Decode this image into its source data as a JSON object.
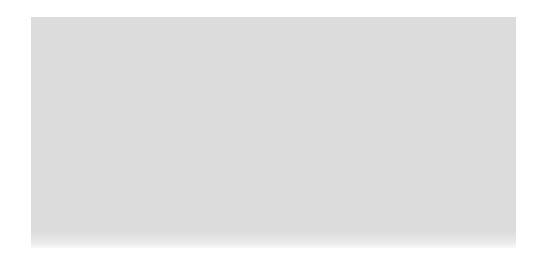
{
  "canvas": {
    "width": 547,
    "height": 267,
    "background_color": "#ffffff",
    "description": "Blank white page containing a single featureless dithered gray rectangle; no text, icons, controls or chrome are visible."
  },
  "block": {
    "name": "gray-dither-block",
    "x": 31,
    "y": 17,
    "width": 485,
    "height": 231,
    "average_color": "#dcdcdc",
    "dither_dark_color": "#cfcfcf",
    "dither_light_color": "#ffffff",
    "corner_style": "square",
    "border": "none",
    "texture": "1px random grayscale dither / noise",
    "bottom_edge": "soft fade to white",
    "content": ""
  }
}
